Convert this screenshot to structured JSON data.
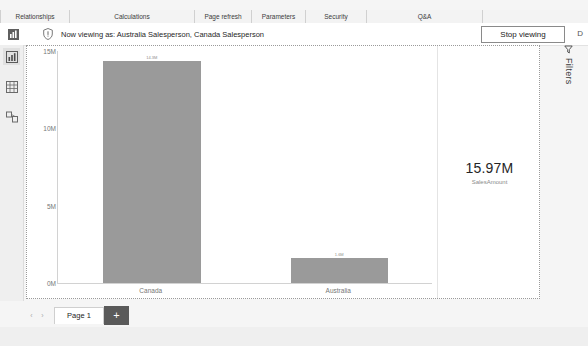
{
  "ribbon": {
    "groups": [
      {
        "label": "Relationships",
        "width": 68
      },
      {
        "label": "Calculations",
        "width": 124
      },
      {
        "label": "Page refresh",
        "width": 56
      },
      {
        "label": "Parameters",
        "width": 53
      },
      {
        "label": "Security",
        "width": 60
      },
      {
        "label": "Q&A",
        "width": 115
      }
    ]
  },
  "banner": {
    "report_icon": "report-view-icon",
    "info_icon": "shield-warning-icon",
    "message": "Now viewing as: Australia Salesperson, Canada Salesperson",
    "stop_button": "Stop viewing",
    "edge_char": "D"
  },
  "left_rail": {
    "items": [
      {
        "name": "report-view",
        "icon": "bar-chart-icon",
        "active": true
      },
      {
        "name": "data-view",
        "icon": "table-grid-icon",
        "active": false
      },
      {
        "name": "model-view",
        "icon": "relationships-icon",
        "active": false
      }
    ]
  },
  "filters": {
    "icon": "filter-funnel-icon",
    "label": "Filters"
  },
  "card_visual": {
    "value": "15.97M",
    "label": "SalesAmount"
  },
  "pagebar": {
    "prev_arrow": "‹",
    "next_arrow": "›",
    "tabs": [
      {
        "label": "Page 1",
        "active": true
      }
    ],
    "add_label": "+"
  },
  "chart_data": {
    "type": "bar",
    "title": "",
    "xlabel": "",
    "ylabel": "",
    "categories": [
      "Canada",
      "Australia"
    ],
    "values": [
      14.35,
      1.62
    ],
    "value_labels": [
      "14.3M",
      "1.6M"
    ],
    "ylim": [
      0,
      15
    ],
    "yticks": [
      0,
      5,
      10,
      15
    ],
    "ytick_labels": [
      "0M",
      "5M",
      "10M",
      "15M"
    ],
    "grid": false,
    "legend": "none",
    "bar_color": "#9a9a9a"
  }
}
